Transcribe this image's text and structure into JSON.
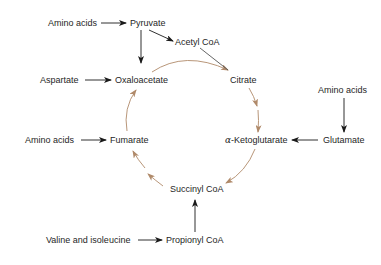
{
  "diagram": {
    "title": "",
    "colors": {
      "text": "#262626",
      "feeder_arrow": "#1a1a1a",
      "cycle_arrow": "#b08a6a",
      "background": "#ffffff"
    },
    "nodes": {
      "amino_acids_top": "Amino acids",
      "pyruvate": "Pyruvate",
      "acetyl_coa": "Acetyl CoA",
      "aspartate": "Aspartate",
      "oxaloacetate": "Oxaloacetate",
      "citrate": "Citrate",
      "amino_acids_right": "Amino acids",
      "amino_acids_left": "Amino acids",
      "fumarate": "Fumarate",
      "alpha_prefix": "α",
      "ketoglutarate": "-Ketoglutarate",
      "glutamate": "Glutamate",
      "succinyl_coa": "Succinyl CoA",
      "valine_isoleucine": "Valine and isoleucine",
      "propionyl_coa": "Propionyl CoA"
    },
    "edges": [
      {
        "from": "Amino acids",
        "to": "Pyruvate",
        "type": "feeder"
      },
      {
        "from": "Pyruvate",
        "to": "Oxaloacetate",
        "type": "feeder"
      },
      {
        "from": "Pyruvate",
        "to": "Acetyl CoA",
        "type": "feeder"
      },
      {
        "from": "Aspartate",
        "to": "Oxaloacetate",
        "type": "feeder"
      },
      {
        "from": "Amino acids",
        "to": "Glutamate",
        "type": "feeder"
      },
      {
        "from": "Glutamate",
        "to": "α-Ketoglutarate",
        "type": "feeder"
      },
      {
        "from": "Amino acids",
        "to": "Fumarate",
        "type": "feeder"
      },
      {
        "from": "Valine and isoleucine",
        "to": "Propionyl CoA",
        "type": "feeder"
      },
      {
        "from": "Propionyl CoA",
        "to": "Succinyl CoA",
        "type": "feeder"
      },
      {
        "from": "Oxaloacetate",
        "to": "Citrate",
        "type": "cycle"
      },
      {
        "from": "Acetyl CoA",
        "to": "Citrate",
        "type": "cycle"
      },
      {
        "from": "Citrate",
        "to": "α-Ketoglutarate",
        "type": "cycle"
      },
      {
        "from": "α-Ketoglutarate",
        "to": "Succinyl CoA",
        "type": "cycle"
      },
      {
        "from": "Succinyl CoA",
        "to": "Fumarate",
        "type": "cycle"
      },
      {
        "from": "Fumarate",
        "to": "Oxaloacetate",
        "type": "cycle"
      }
    ]
  }
}
